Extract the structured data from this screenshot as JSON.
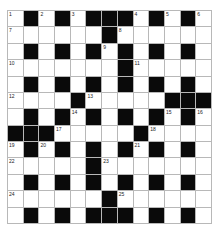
{
  "puzzle": {
    "rows": 13,
    "cols": 13,
    "colors": {
      "black": "#0a0a0a",
      "white": "#ffffff",
      "gridline": "#b8b8b8",
      "number": "#222222"
    },
    "layout": [
      "W.W.W...W.W.W",
      "WWWWWW.WWWWWW",
      "W.W.W.W.W.W.W",
      "WWWWWWW.WWWWW",
      "W.W.W.W.W.W.W",
      "WWWW.WWWWW...",
      "W.W.W.W.W.W.W",
      "...WWWWW.WWWW",
      "W.W.W.W.W.W.W",
      "WWWWW.WWWWWWW",
      "W.W.W.W.W.W.W",
      "WWWWWW.WWWWWW",
      "W.W.W...W.W.W"
    ],
    "numbers": [
      {
        "r": 0,
        "c": 0,
        "n": "1"
      },
      {
        "r": 0,
        "c": 2,
        "n": "2"
      },
      {
        "r": 0,
        "c": 4,
        "n": "3"
      },
      {
        "r": 0,
        "c": 8,
        "n": "4"
      },
      {
        "r": 0,
        "c": 10,
        "n": "5"
      },
      {
        "r": 0,
        "c": 12,
        "n": "6"
      },
      {
        "r": 1,
        "c": 0,
        "n": "7"
      },
      {
        "r": 1,
        "c": 7,
        "n": "8"
      },
      {
        "r": 2,
        "c": 6,
        "n": "9"
      },
      {
        "r": 3,
        "c": 0,
        "n": "10"
      },
      {
        "r": 3,
        "c": 8,
        "n": "11"
      },
      {
        "r": 5,
        "c": 0,
        "n": "12"
      },
      {
        "r": 5,
        "c": 5,
        "n": "13"
      },
      {
        "r": 6,
        "c": 4,
        "n": "14"
      },
      {
        "r": 6,
        "c": 10,
        "n": "15"
      },
      {
        "r": 6,
        "c": 12,
        "n": "16"
      },
      {
        "r": 7,
        "c": 3,
        "n": "17"
      },
      {
        "r": 7,
        "c": 9,
        "n": "18"
      },
      {
        "r": 8,
        "c": 0,
        "n": "19"
      },
      {
        "r": 8,
        "c": 2,
        "n": "20"
      },
      {
        "r": 8,
        "c": 8,
        "n": "21"
      },
      {
        "r": 9,
        "c": 0,
        "n": "22"
      },
      {
        "r": 9,
        "c": 6,
        "n": "23"
      },
      {
        "r": 11,
        "c": 0,
        "n": "24"
      },
      {
        "r": 11,
        "c": 7,
        "n": "25"
      }
    ]
  }
}
